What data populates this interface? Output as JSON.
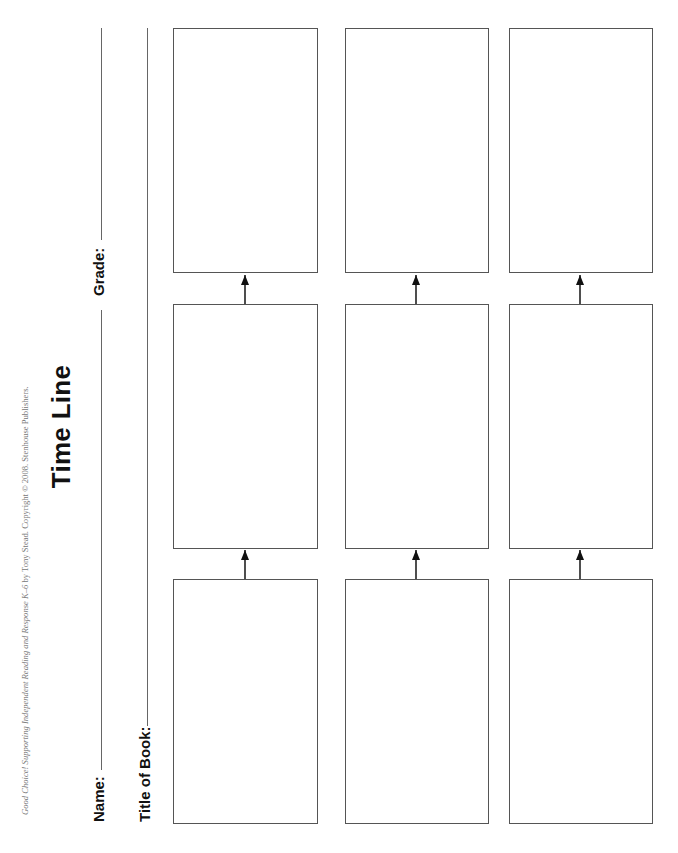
{
  "worksheet": {
    "copyright": {
      "book_title": "Good Choice! Supporting Independent Reading and Response K–6",
      "rest": " by Tony Stead. Copyright © 2008. Stenhouse Publishers."
    },
    "title": "Time Line",
    "fields": {
      "name_label": "Name:",
      "grade_label": "Grade:",
      "title_of_book_label": "Title of Book:"
    },
    "grid": {
      "rows": 3,
      "boxes_per_row": 3,
      "arrow_direction": "left-to-right (sequence)"
    },
    "colors": {
      "ink": "#111111",
      "rule": "#666666",
      "box_border": "#555555",
      "copyright": "#777777"
    }
  }
}
